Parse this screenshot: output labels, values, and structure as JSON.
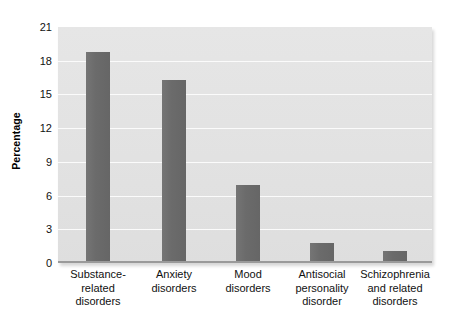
{
  "chart_data": {
    "type": "bar",
    "title": "",
    "subtitle": "",
    "xlabel": "",
    "ylabel": "Percentage",
    "ylim": [
      0,
      21
    ],
    "yticks": [
      0,
      3,
      6,
      9,
      12,
      15,
      18,
      21
    ],
    "ytick_labels": [
      "0",
      "3",
      "6",
      "9",
      "12",
      "15",
      "18",
      "21"
    ],
    "grid": true,
    "legend": false,
    "legend_position": "none",
    "orientation": "vertical",
    "categories": [
      "Substance-related disorders",
      "Anxiety disorders",
      "Mood disorders",
      "Antisocial personality disorder",
      "Schizophrenia and related disorders"
    ],
    "category_lines": [
      [
        "Substance-",
        "related",
        "disorders"
      ],
      [
        "Anxiety",
        "disorders"
      ],
      [
        "Mood",
        "disorders"
      ],
      [
        "Antisocial",
        "personality",
        "disorder"
      ],
      [
        "Schizophrenia",
        "and related",
        "disorders"
      ]
    ],
    "values": [
      18.8,
      16.3,
      6.9,
      1.8,
      1.1
    ],
    "series": [
      {
        "name": "Percentage",
        "values": [
          18.8,
          16.3,
          6.9,
          1.8,
          1.1
        ]
      }
    ],
    "colors": {
      "bar": "#6d6d6d",
      "plot_background": "#e4e4e4",
      "gridline": "#fbfbfb",
      "axis": "#9a9a9a",
      "text": "#111111",
      "page_background": "#ffffff"
    }
  }
}
